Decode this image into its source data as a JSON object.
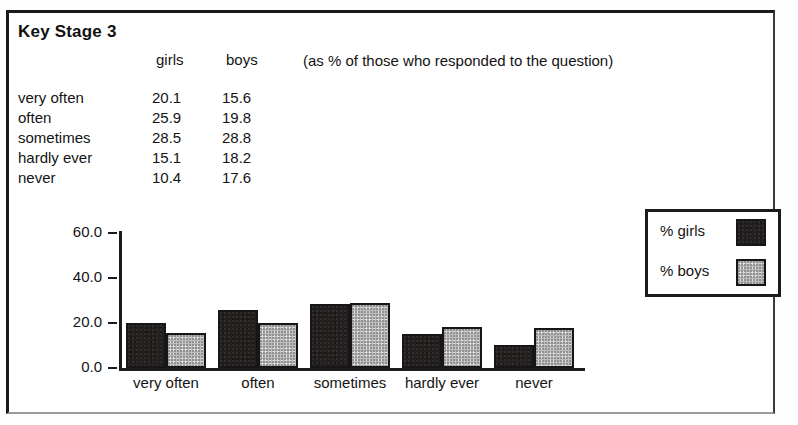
{
  "document": {
    "title": "Key Stage 3",
    "note": "(as % of those who responded to the question)"
  },
  "table": {
    "headers": [
      "",
      "girls",
      "boys"
    ],
    "rows": [
      {
        "label": "very often",
        "girls": "20.1",
        "boys": "15.6"
      },
      {
        "label": "often",
        "girls": "25.9",
        "boys": "19.8"
      },
      {
        "label": "sometimes",
        "girls": "28.5",
        "boys": "28.8"
      },
      {
        "label": "hardly ever",
        "girls": "15.1",
        "boys": "18.2"
      },
      {
        "label": "never",
        "girls": "10.4",
        "boys": "17.6"
      }
    ]
  },
  "legend": {
    "items": [
      {
        "label": "% girls",
        "color": "#231f1f"
      },
      {
        "label": "% boys",
        "color": "#bcbcbc"
      }
    ]
  },
  "axis": {
    "yticks": [
      "60.0",
      "40.0",
      "20.0",
      "0.0"
    ],
    "xticks": [
      "very often",
      "often",
      "sometimes",
      "hardly ever",
      "never"
    ]
  },
  "chart_data": {
    "type": "bar",
    "title": "Key Stage 3",
    "subtitle": "(as % of those who responded to the question)",
    "categories": [
      "very often",
      "often",
      "sometimes",
      "hardly ever",
      "never"
    ],
    "series": [
      {
        "name": "% girls",
        "values": [
          20.1,
          25.9,
          28.5,
          15.1,
          10.4
        ],
        "color": "#231f1f"
      },
      {
        "name": "% boys",
        "values": [
          15.6,
          19.8,
          28.8,
          18.2,
          17.6
        ],
        "color": "#bcbcbc"
      }
    ],
    "xlabel": "",
    "ylabel": "",
    "ylim": [
      0,
      60
    ],
    "yticks": [
      0,
      20,
      40,
      60
    ],
    "grid": false,
    "legend_position": "right"
  }
}
